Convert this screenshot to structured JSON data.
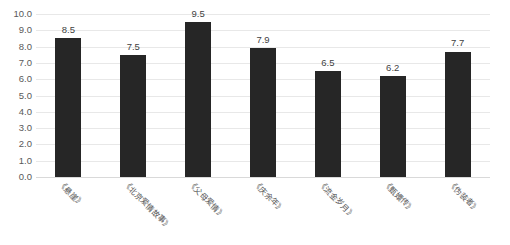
{
  "chart_data": {
    "type": "bar",
    "title": "",
    "xlabel": "",
    "ylabel": "",
    "ylim": [
      0.0,
      10.0
    ],
    "ytick_step": 1.0,
    "grid": true,
    "legend": "none",
    "bar_color": "#262626",
    "gridline_color": "#e8e8e8",
    "categories": [
      "《悬崖》",
      "《北京爱情故事》",
      "《父母爱情》",
      "《庆余年》",
      "《流金岁月》",
      "《甄嬛传》",
      "《伪装者》"
    ],
    "values": [
      8.5,
      7.5,
      9.5,
      7.9,
      6.5,
      6.2,
      7.7
    ],
    "value_labels": [
      "8.5",
      "7.5",
      "9.5",
      "7.9",
      "6.5",
      "6.2",
      "7.7"
    ],
    "ytick_labels": [
      "10.0",
      "9.0",
      "8.0",
      "7.0",
      "6.0",
      "5.0",
      "4.0",
      "3.0",
      "2.0",
      "1.0",
      "0.0"
    ],
    "ytick_values": [
      10.0,
      9.0,
      8.0,
      7.0,
      6.0,
      5.0,
      4.0,
      3.0,
      2.0,
      1.0,
      0.0
    ]
  }
}
